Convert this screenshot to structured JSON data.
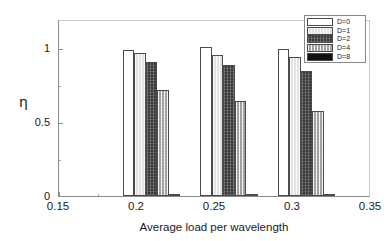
{
  "chart_data": {
    "type": "bar",
    "title": "",
    "xlabel": "Average load per wavelength",
    "ylabel": "η",
    "categories": [
      "0.2",
      "0.25",
      "0.3"
    ],
    "x": [
      0.2,
      0.25,
      0.3
    ],
    "xlim": [
      0.15,
      0.35
    ],
    "ylim": [
      0,
      1.2
    ],
    "xticks": [
      "0.15",
      "0.2",
      "0.25",
      "0.3",
      "0.35"
    ],
    "xtick_values": [
      0.15,
      0.2,
      0.25,
      0.3,
      0.35
    ],
    "yticks": [
      "0",
      "0.5",
      "1"
    ],
    "ytick_values": [
      0,
      0.5,
      1
    ],
    "grid": false,
    "legend_position": "upper right",
    "series": [
      {
        "name": "D=0",
        "color": "#ffffff",
        "values": [
          1.0,
          1.02,
          1.01
        ]
      },
      {
        "name": "D=1",
        "color": "#e3e3e3",
        "values": [
          0.98,
          0.97,
          0.95
        ]
      },
      {
        "name": "D=2",
        "color": "#3a3a3a",
        "values": [
          0.92,
          0.9,
          0.86
        ]
      },
      {
        "name": "D=4",
        "color": "#c3c3c3",
        "values": [
          0.73,
          0.65,
          0.58
        ]
      },
      {
        "name": "D=8",
        "color": "#111111",
        "values": [
          0.01,
          0.01,
          0.01
        ]
      }
    ]
  },
  "axes": {
    "ylabel": "η",
    "xlabel": "Average load per wavelength",
    "ytick_labels": [
      "1",
      "0.5",
      "0"
    ],
    "xtick_labels": [
      "0.15",
      "0.2",
      "0.25",
      "0.3",
      "0.35"
    ]
  },
  "legend": {
    "entries": [
      {
        "label": "D=0"
      },
      {
        "label": "D=1"
      },
      {
        "label": "D=2"
      },
      {
        "label": "D=4"
      },
      {
        "label": "D=8"
      }
    ]
  }
}
